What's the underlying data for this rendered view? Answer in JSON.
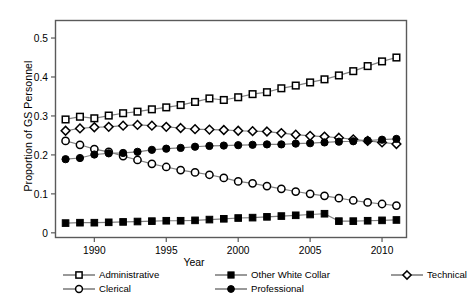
{
  "chart_data": {
    "type": "line",
    "title": "",
    "xlabel": "Year",
    "ylabel": "Proportion of GS Personnel",
    "xlim": [
      1987.3,
      2011.7
    ],
    "ylim": [
      -0.012,
      0.545
    ],
    "xticks": [
      1990,
      1995,
      2000,
      2005,
      2010
    ],
    "xticklabels": [
      "1990",
      "1995",
      "2000",
      "2005",
      "2010"
    ],
    "yticks": [
      0,
      0.1,
      0.2,
      0.3,
      0.4,
      0.5
    ],
    "yticklabels": [
      "0",
      "0.1",
      "0.2",
      "0.3",
      "0.4",
      "0.5"
    ],
    "grid": false,
    "legend_position": "below",
    "x": [
      1988,
      1989,
      1990,
      1991,
      1992,
      1993,
      1994,
      1995,
      1996,
      1997,
      1998,
      1999,
      2000,
      2001,
      2002,
      2003,
      2004,
      2005,
      2006,
      2007,
      2008,
      2009,
      2010,
      2011
    ],
    "series": [
      {
        "name": "Administrative",
        "marker": "open-square",
        "color": "#000000",
        "values": [
          0.291,
          0.298,
          0.294,
          0.301,
          0.307,
          0.311,
          0.317,
          0.322,
          0.328,
          0.336,
          0.345,
          0.341,
          0.348,
          0.356,
          0.361,
          0.371,
          0.378,
          0.386,
          0.394,
          0.404,
          0.415,
          0.428,
          0.44,
          0.45
        ]
      },
      {
        "name": "Other White Collar",
        "marker": "filled-square",
        "color": "#000000",
        "values": [
          0.025,
          0.026,
          0.026,
          0.027,
          0.028,
          0.029,
          0.03,
          0.031,
          0.031,
          0.032,
          0.034,
          0.036,
          0.038,
          0.039,
          0.041,
          0.043,
          0.045,
          0.047,
          0.049,
          0.03,
          0.03,
          0.031,
          0.032,
          0.033
        ]
      },
      {
        "name": "Technical",
        "marker": "open-diamond",
        "color": "#000000",
        "values": [
          0.262,
          0.268,
          0.271,
          0.272,
          0.275,
          0.277,
          0.275,
          0.272,
          0.269,
          0.266,
          0.265,
          0.264,
          0.262,
          0.261,
          0.26,
          0.256,
          0.252,
          0.249,
          0.247,
          0.244,
          0.24,
          0.236,
          0.232,
          0.228
        ]
      },
      {
        "name": "Clerical",
        "marker": "open-circle",
        "color": "#000000",
        "values": [
          0.236,
          0.226,
          0.215,
          0.208,
          0.197,
          0.187,
          0.177,
          0.169,
          0.161,
          0.155,
          0.149,
          0.141,
          0.132,
          0.127,
          0.12,
          0.113,
          0.106,
          0.1,
          0.095,
          0.089,
          0.083,
          0.078,
          0.074,
          0.07
        ]
      },
      {
        "name": "Professional",
        "marker": "filled-circle",
        "color": "#000000",
        "values": [
          0.189,
          0.192,
          0.201,
          0.204,
          0.205,
          0.208,
          0.213,
          0.216,
          0.218,
          0.221,
          0.223,
          0.224,
          0.225,
          0.226,
          0.227,
          0.227,
          0.229,
          0.23,
          0.232,
          0.234,
          0.235,
          0.237,
          0.239,
          0.241
        ]
      }
    ]
  }
}
